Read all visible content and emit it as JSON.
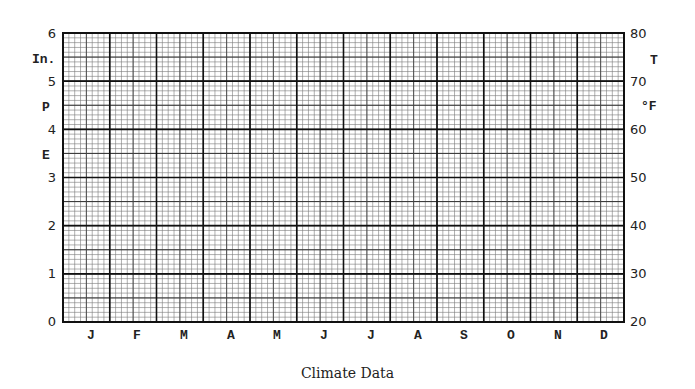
{
  "chart_data": {
    "type": "line",
    "title": "Climate Data",
    "categories": [
      "J",
      "F",
      "M",
      "A",
      "M",
      "J",
      "J",
      "A",
      "S",
      "O",
      "N",
      "D"
    ],
    "series": [],
    "left_axis": {
      "label_lines": [
        "In.",
        "P",
        "E"
      ],
      "ticks": [
        "0",
        "1",
        "2",
        "3",
        "4",
        "5",
        "6"
      ],
      "ylim": [
        0,
        6
      ],
      "meaning": "Precipitation (inches)"
    },
    "right_axis": {
      "label_lines": [
        "T",
        "°F"
      ],
      "ticks": [
        "20",
        "30",
        "40",
        "50",
        "60",
        "70",
        "80"
      ],
      "ylim": [
        20,
        80
      ],
      "meaning": "Temperature (°F)"
    },
    "xlabel": "",
    "grid": true,
    "legend": null
  },
  "caption": "Climate Data",
  "months": [
    "J",
    "F",
    "M",
    "A",
    "M",
    "J",
    "J",
    "A",
    "S",
    "O",
    "N",
    "D"
  ],
  "left_ticks": [
    "6",
    "5",
    "4",
    "3",
    "2",
    "1",
    "0"
  ],
  "right_ticks": [
    "80",
    "70",
    "60",
    "50",
    "40",
    "30",
    "20"
  ],
  "left_labels": {
    "in": "In.",
    "p": "P",
    "e": "E"
  },
  "right_labels": {
    "t": "T",
    "f": "°F"
  }
}
